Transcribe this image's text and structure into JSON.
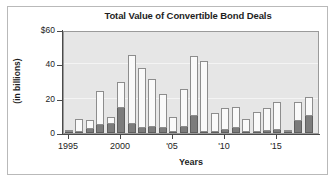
{
  "chart_data": {
    "type": "bar",
    "title": "Total Value of Convertible Bond Deals",
    "xlabel": "Years",
    "ylabel": "(in billions)",
    "ylim": [
      0,
      60
    ],
    "ytick_labels": [
      "$60",
      "40",
      "20",
      "0"
    ],
    "ytick_values": [
      60,
      40,
      20,
      0
    ],
    "xtick_labels": [
      "1995",
      "2000",
      "'05",
      "'10",
      "'15"
    ],
    "xtick_values": [
      1995,
      2000,
      2005,
      2010,
      2015
    ],
    "grid": "horizontal",
    "legend": "none",
    "stacked": true,
    "categories": [
      "1995",
      "1996",
      "1997",
      "1998",
      "1999",
      "2000",
      "2001",
      "2002",
      "2003",
      "2004",
      "2005",
      "2006",
      "2007",
      "2008",
      "2009",
      "2010",
      "2011",
      "2012",
      "2013",
      "2014",
      "2015",
      "2016",
      "2017",
      "2018"
    ],
    "series": [
      {
        "name": "lower-segment",
        "color": "#7c7c7c",
        "values": [
          0.7,
          0.8,
          2.2,
          4.6,
          5.2,
          14.8,
          5.0,
          2.8,
          3.3,
          2.7,
          0.7,
          3.4,
          10.2,
          0.6,
          0.5,
          2.0,
          3.0,
          0.7,
          0.6,
          1.2,
          2.0,
          0.4,
          7.0,
          10.0
        ]
      },
      {
        "name": "upper-segment",
        "color": "#fafafa",
        "values": [
          0.3,
          7.4,
          5.3,
          19.6,
          4.1,
          14.7,
          40.3,
          35.1,
          28.2,
          19.8,
          8.4,
          22.4,
          34.5,
          41.4,
          11.0,
          12.8,
          12.0,
          7.7,
          11.6,
          13.6,
          16.0,
          1.0,
          11.0,
          10.8
        ]
      }
    ],
    "totals": [
      1.0,
      8.2,
      7.5,
      24.2,
      9.3,
      29.5,
      45.3,
      37.9,
      31.5,
      22.5,
      9.1,
      25.8,
      44.7,
      42.0,
      11.5,
      14.8,
      15.0,
      8.4,
      12.2,
      14.8,
      18.0,
      1.4,
      18.0,
      20.8
    ]
  },
  "colors": {
    "plot_background": "#e6e6e6",
    "bar_dark": "#7c7c7c",
    "bar_light": "#fafafa",
    "axis": "#4a4a4a",
    "text": "#232323",
    "frame": "#b9b9b9"
  }
}
